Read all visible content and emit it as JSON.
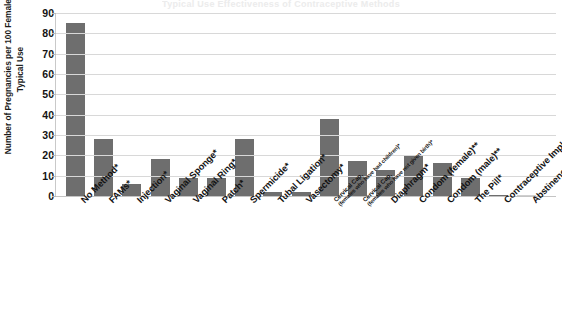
{
  "chart_data": {
    "type": "bar",
    "title": "Typical Use Effectiveness of Contraceptive Methods",
    "xlabel": "",
    "ylabel": "Number of Pregnancies per 100 Females in Typical Use",
    "ylim": [
      0,
      90
    ],
    "ytick_step": 10,
    "yticks": [
      90,
      80,
      70,
      60,
      50,
      40,
      30,
      20,
      10,
      0
    ],
    "grid": true,
    "legend": "none",
    "bar_color": "#6e6e6e",
    "gridline_color": "#d8d8d8",
    "axis_color": "#c4c4c4",
    "categories": [
      "No Method*",
      "FAMs*",
      "Injection*",
      "Vaginal Sponge*",
      "Vaginal Ring*",
      "Patch*",
      "Spermicide*",
      "Tubal Ligation*",
      "Vasectomy*",
      "Cervical Cap (females who have had children)*",
      "Cervical Cap (females who have not given birth)*",
      "Diaphragm*",
      "Condom (female)**",
      "Condom (male)**",
      "The Pill*",
      "Contraceptive Implant*",
      "Abstinence***"
    ],
    "categories_display": [
      {
        "main": "No Method*",
        "sub": ""
      },
      {
        "main": "FAMs*",
        "sub": ""
      },
      {
        "main": "Injection*",
        "sub": ""
      },
      {
        "main": "Vaginal Sponge*",
        "sub": ""
      },
      {
        "main": "Vaginal Ring*",
        "sub": ""
      },
      {
        "main": "Patch*",
        "sub": ""
      },
      {
        "main": "Spermicide*",
        "sub": ""
      },
      {
        "main": "Tubal Ligation*",
        "sub": ""
      },
      {
        "main": "Vasectomy*",
        "sub": ""
      },
      {
        "main": "Cervical Cap,",
        "sub": "(females who have had children)*"
      },
      {
        "main": "Cervical Cap,",
        "sub": "(females who have not given birth)*"
      },
      {
        "main": "Diaphragm*",
        "sub": ""
      },
      {
        "main": "Condom (female)**",
        "sub": ""
      },
      {
        "main": "Condom (male)**",
        "sub": ""
      },
      {
        "main": "The Pill*",
        "sub": ""
      },
      {
        "main": "Contraceptive Implant*",
        "sub": ""
      },
      {
        "main": "Abstinence***",
        "sub": ""
      }
    ],
    "values": [
      85,
      28,
      6,
      18,
      9,
      9,
      28,
      2,
      2,
      38,
      17,
      13,
      20,
      16,
      9,
      0.5,
      0
    ]
  }
}
